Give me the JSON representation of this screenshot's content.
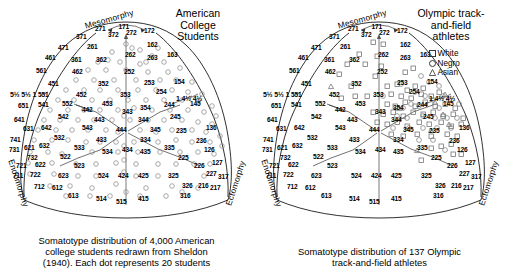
{
  "figure": {
    "kind": "somatotype-distribution-pair"
  },
  "panels": [
    {
      "id": "american-college-students",
      "title": "American\nCollege\nStudents",
      "caption": "Somatotype distribution of 4,000 American\ncollege students redrawn from Sheldon\n(1940).  Each dot represents 20 students",
      "marker": "open-circle",
      "has_legend": false
    },
    {
      "id": "olympic-athletes",
      "title": "Olympic track-\nand-field\nathletes",
      "caption": "Somatotype distribution of 137 Olympic\ntrack-and-field athletes",
      "marker": "mixed",
      "has_legend": true,
      "legend": [
        {
          "mark": "square",
          "label": "White"
        },
        {
          "mark": "circle",
          "label": "Negro"
        },
        {
          "mark": "triangle",
          "label": "Asian"
        }
      ]
    }
  ],
  "axes": {
    "mesomorphy": "Mesomorphy",
    "endomorphy": "Endomorphy",
    "ectomorphy": "Ectomorphy"
  },
  "corner_ratings": {
    "left": "5½ 5½ 1",
    "right": "1 4½ 4½"
  },
  "chart_data": {
    "type": "scatter",
    "xlabel": "Endomorphy – Ectomorphy balance",
    "ylabel": "Mesomorphy",
    "grid": "somatochart-triangular",
    "legend_position": "top-right of right panel",
    "somatotype_labels": [
      {
        "code": "171",
        "x": 126.5,
        "y": 27.0
      },
      {
        "code": "271",
        "x": 103.0,
        "y": 29.0
      },
      {
        "code": "172",
        "x": 152.0,
        "y": 31.0
      },
      {
        "code": "371",
        "x": 84.0,
        "y": 37.0
      },
      {
        "code": "372",
        "x": 116.0,
        "y": 35.0
      },
      {
        "code": "272",
        "x": 134.0,
        "y": 33.0
      },
      {
        "code": "471",
        "x": 66.0,
        "y": 48.0
      },
      {
        "code": "261",
        "x": 95.0,
        "y": 47.0
      },
      {
        "code": "162",
        "x": 155.0,
        "y": 45.0
      },
      {
        "code": "461",
        "x": 53.0,
        "y": 58.0
      },
      {
        "code": "361",
        "x": 79.0,
        "y": 60.0
      },
      {
        "code": "362",
        "x": 104.0,
        "y": 60.0
      },
      {
        "code": "262",
        "x": 133.0,
        "y": 55.0
      },
      {
        "code": "263",
        "x": 155.0,
        "y": 58.0
      },
      {
        "code": "163",
        "x": 175.0,
        "y": 55.0
      },
      {
        "code": "561",
        "x": 44.0,
        "y": 71.0
      },
      {
        "code": "462",
        "x": 80.0,
        "y": 72.0
      },
      {
        "code": "252",
        "x": 132.0,
        "y": 72.0
      },
      {
        "code": "451",
        "x": 56.0,
        "y": 84.0
      },
      {
        "code": "352",
        "x": 106.0,
        "y": 84.0
      },
      {
        "code": "253",
        "x": 152.0,
        "y": 83.0
      },
      {
        "code": "154",
        "x": 182.0,
        "y": 82.0
      },
      {
        "code": "551",
        "x": 46.0,
        "y": 95.0
      },
      {
        "code": "452",
        "x": 84.0,
        "y": 95.0
      },
      {
        "code": "353",
        "x": 128.0,
        "y": 95.0
      },
      {
        "code": "254",
        "x": 164.0,
        "y": 92.0
      },
      {
        "code": "651",
        "x": 26.0,
        "y": 106.0
      },
      {
        "code": "541",
        "x": 46.0,
        "y": 105.0
      },
      {
        "code": "552",
        "x": 70.0,
        "y": 104.0
      },
      {
        "code": "453",
        "x": 110.0,
        "y": 104.0
      },
      {
        "code": "354",
        "x": 148.0,
        "y": 108.0
      },
      {
        "code": "244",
        "x": 172.0,
        "y": 105.0
      },
      {
        "code": "145",
        "x": 198.0,
        "y": 104.0
      },
      {
        "code": "442",
        "x": 90.0,
        "y": 110.0
      },
      {
        "code": "343",
        "x": 130.0,
        "y": 112.0
      },
      {
        "code": "641",
        "x": 22.0,
        "y": 120.0
      },
      {
        "code": "542",
        "x": 66.0,
        "y": 117.0
      },
      {
        "code": "443",
        "x": 102.0,
        "y": 120.0
      },
      {
        "code": "344",
        "x": 146.0,
        "y": 120.0
      },
      {
        "code": "245",
        "x": 178.0,
        "y": 117.0
      },
      {
        "code": "631",
        "x": 31.0,
        "y": 129.0
      },
      {
        "code": "642",
        "x": 49.0,
        "y": 128.0
      },
      {
        "code": "543",
        "x": 90.0,
        "y": 128.0
      },
      {
        "code": "444",
        "x": 124.0,
        "y": 130.0
      },
      {
        "code": "345",
        "x": 158.0,
        "y": 130.0
      },
      {
        "code": "235",
        "x": 184.0,
        "y": 131.0
      },
      {
        "code": "136",
        "x": 214.0,
        "y": 128.0
      },
      {
        "code": "741",
        "x": 18.0,
        "y": 140.0
      },
      {
        "code": "532",
        "x": 62.0,
        "y": 138.0
      },
      {
        "code": "433",
        "x": 104.0,
        "y": 140.0
      },
      {
        "code": "334",
        "x": 148.0,
        "y": 140.0
      },
      {
        "code": "236",
        "x": 204.0,
        "y": 141.0
      },
      {
        "code": "731",
        "x": 17.0,
        "y": 150.0
      },
      {
        "code": "621",
        "x": 32.0,
        "y": 148.0
      },
      {
        "code": "632",
        "x": 47.0,
        "y": 146.0
      },
      {
        "code": "533",
        "x": 82.0,
        "y": 148.0
      },
      {
        "code": "534",
        "x": 110.0,
        "y": 152.0
      },
      {
        "code": "434",
        "x": 130.0,
        "y": 150.0
      },
      {
        "code": "435",
        "x": 148.0,
        "y": 152.0
      },
      {
        "code": "335",
        "x": 172.0,
        "y": 148.0
      },
      {
        "code": "126",
        "x": 212.0,
        "y": 150.0
      },
      {
        "code": "732",
        "x": 35.0,
        "y": 158.0
      },
      {
        "code": "522",
        "x": 68.0,
        "y": 157.0
      },
      {
        "code": "225",
        "x": 186.0,
        "y": 158.0
      },
      {
        "code": "721",
        "x": 24.0,
        "y": 166.0
      },
      {
        "code": "622",
        "x": 43.0,
        "y": 165.0
      },
      {
        "code": "523",
        "x": 82.0,
        "y": 166.0
      },
      {
        "code": "226",
        "x": 202.0,
        "y": 166.0
      },
      {
        "code": "127",
        "x": 220.0,
        "y": 163.0
      },
      {
        "code": "711",
        "x": 21.0,
        "y": 176.0
      },
      {
        "code": "722",
        "x": 38.0,
        "y": 175.0
      },
      {
        "code": "623",
        "x": 66.0,
        "y": 176.0
      },
      {
        "code": "524",
        "x": 106.0,
        "y": 176.0
      },
      {
        "code": "424",
        "x": 126.0,
        "y": 176.0
      },
      {
        "code": "425",
        "x": 146.0,
        "y": 176.0
      },
      {
        "code": "325",
        "x": 176.0,
        "y": 176.0
      },
      {
        "code": "227",
        "x": 214.0,
        "y": 174.0
      },
      {
        "code": "317",
        "x": 226.0,
        "y": 177.0
      },
      {
        "code": "712",
        "x": 42.0,
        "y": 187.0
      },
      {
        "code": "612",
        "x": 60.0,
        "y": 188.0
      },
      {
        "code": "326",
        "x": 190.0,
        "y": 186.0
      },
      {
        "code": "216",
        "x": 206.0,
        "y": 186.0
      },
      {
        "code": "217",
        "x": 218.0,
        "y": 188.0
      },
      {
        "code": "613",
        "x": 76.0,
        "y": 196.0
      },
      {
        "code": "316",
        "x": 188.0,
        "y": 196.0
      },
      {
        "code": "514",
        "x": 104.0,
        "y": 199.0
      },
      {
        "code": "515",
        "x": 124.0,
        "y": 202.0
      },
      {
        "code": "415",
        "x": 146.0,
        "y": 199.0
      }
    ],
    "american_students": {
      "n": 4000,
      "dot_value": 20,
      "marker": "open-circle",
      "distribution": "broad, fills most of the somatochart with a dense central mass around 444/353/343"
    },
    "olympic_athletes": {
      "n": 137,
      "groups": [
        {
          "name": "White",
          "marker": "square"
        },
        {
          "name": "Negro",
          "marker": "circle"
        },
        {
          "name": "Asian",
          "marker": "triangle"
        }
      ],
      "distribution": "tight cluster in the mesomorphic–ectomorphic sector around 253/254/344/345/244"
    }
  }
}
